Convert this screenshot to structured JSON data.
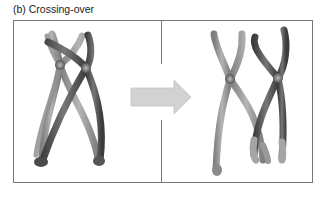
{
  "figure": {
    "caption": "(b) Crossing-over",
    "panels": [
      {
        "name": "before",
        "description": "Homologous chromosomes with non-sister chromatids crossing (chiasma)"
      },
      {
        "name": "after",
        "description": "Chromosomes after exchange of chromatid segments"
      }
    ],
    "arrow": {
      "direction": "right",
      "color": "#cfcfcf"
    },
    "colors": {
      "light_chromatid": "#9a9a9a",
      "dark_chromatid": "#555555",
      "centromere": "#707070",
      "frame": "#777777"
    }
  }
}
